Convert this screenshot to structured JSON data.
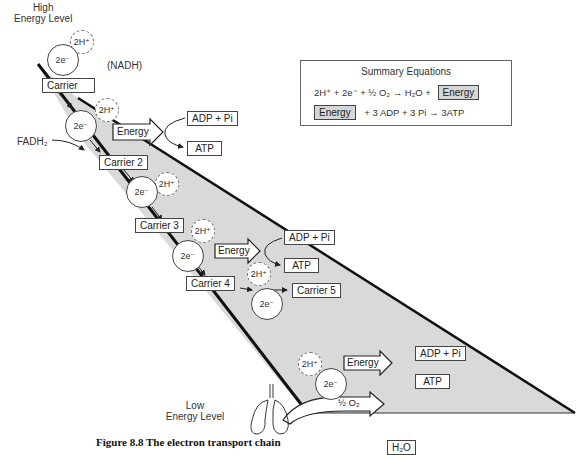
{
  "figure": {
    "high_label": "High\nEnergy Level",
    "low_label": "Low\nEnergy Level",
    "nadh_label": "(NADH)",
    "fadh2_label": "FADH₂",
    "electron_label": "2e⁻",
    "proton_label": "2H⁺",
    "carriers": [
      "Carrier",
      "Carrier 2",
      "Carrier 3",
      "Carrier 4",
      "Carrier 5"
    ],
    "energy_label": "Energy",
    "adp_label": "ADP + Pi",
    "atp_label": "ATP",
    "oxygen_label": "½ O₂",
    "water_label": "H₂O",
    "caption": "Figure 8.8  The electron transport chain"
  },
  "summary": {
    "title": "Summary Equations",
    "eq1_left": "2H⁺ + 2e⁻ + ½ O₂ → H₂O +",
    "eq1_box": "Energy",
    "eq2_box": "Energy",
    "eq2_right": "+ 3 ADP + 3 Pi → 3ATP"
  },
  "colors": {
    "band_fill": "#d9d9d9",
    "stroke": "#111111",
    "energy_box": "#d6d6d6"
  }
}
